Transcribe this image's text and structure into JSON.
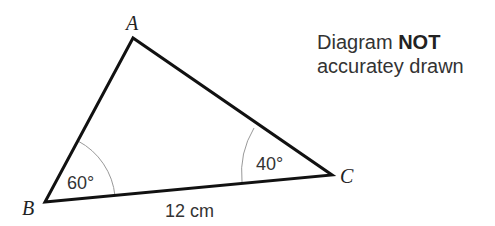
{
  "diagram": {
    "type": "triangle",
    "vertices": {
      "A": {
        "label": "A",
        "x": 133,
        "y": 38
      },
      "B": {
        "label": "B",
        "x": 45,
        "y": 202
      },
      "C": {
        "label": "C",
        "x": 332,
        "y": 175
      }
    },
    "angles": {
      "B": "60°",
      "C": "40°"
    },
    "sides": {
      "BC": "12 cm"
    }
  },
  "note": {
    "line1_prefix": "Diagram",
    "line1_bold": "NOT",
    "line2": "accuratey drawn"
  }
}
